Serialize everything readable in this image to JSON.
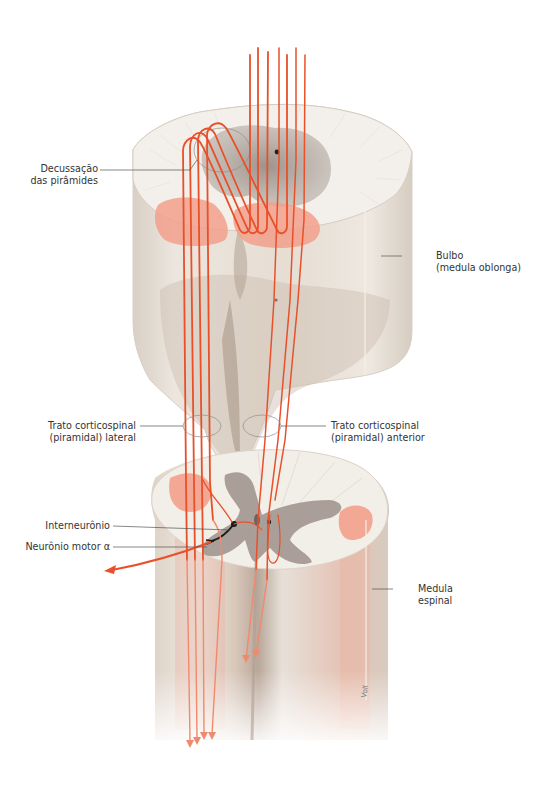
{
  "figure": {
    "type": "anatomical-illustration",
    "colors": {
      "fiber": "#e8502a",
      "fiber_pale": "#f08a6e",
      "tract_fill": "#f2a08c",
      "white_matter": "#efebe4",
      "gray_matter": "#9a8f88",
      "tissue_shadow": "#d8cdc2",
      "leader_line": "#555555",
      "text": "#333333"
    }
  },
  "labels": {
    "decussation": {
      "line1": "Decussação",
      "line2": "das pirâmides"
    },
    "bulbo": {
      "line1": "Bulbo",
      "line2": "(medula oblonga)"
    },
    "lateral_tract": {
      "line1": "Trato corticospinal",
      "line2": "(piramidal) lateral"
    },
    "anterior_tract": {
      "line1": "Trato corticospinal",
      "line2": "(piramidal) anterior"
    },
    "interneuron": {
      "line1": "Interneurônio"
    },
    "motor_neuron": {
      "line1": "Neurônio motor α"
    },
    "spinal_cord": {
      "line1": "Medula",
      "line2": "espinal"
    }
  },
  "signature": "Voll"
}
